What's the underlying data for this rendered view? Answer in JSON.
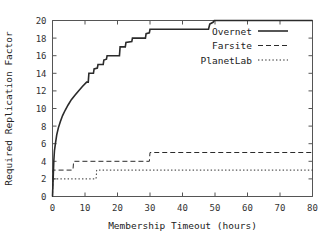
{
  "chart_data": {
    "type": "line",
    "title": "",
    "xlabel": "Membership Timeout (hours)",
    "ylabel": "Required Replication Factor",
    "xlim": [
      0,
      80
    ],
    "ylim": [
      0,
      20
    ],
    "xticks": [
      0,
      10,
      20,
      30,
      40,
      50,
      60,
      70,
      80
    ],
    "yticks": [
      0,
      2,
      4,
      6,
      8,
      10,
      12,
      14,
      16,
      18,
      20
    ],
    "xtick_labels": [
      "0",
      "10",
      "20",
      "30",
      "40",
      "50",
      "60",
      "70",
      "80"
    ],
    "ytick_labels": [
      "0",
      "2",
      "4",
      "6",
      "8",
      "10",
      "12",
      "14",
      "16",
      "18",
      "20"
    ],
    "grid": false,
    "legend_position": "top-right",
    "series": [
      {
        "name": "Overnet",
        "style": "solid",
        "color": "#2b2b2b",
        "width": 1.6,
        "points": [
          [
            0.0,
            0.0
          ],
          [
            0.2,
            2.0
          ],
          [
            0.4,
            4.0
          ],
          [
            0.6,
            5.2
          ],
          [
            0.9,
            6.0
          ],
          [
            1.3,
            7.0
          ],
          [
            1.8,
            7.8
          ],
          [
            2.4,
            8.5
          ],
          [
            3.1,
            9.2
          ],
          [
            3.9,
            9.8
          ],
          [
            4.8,
            10.4
          ],
          [
            5.8,
            11.0
          ],
          [
            6.9,
            11.5
          ],
          [
            8.0,
            12.0
          ],
          [
            9.2,
            12.5
          ],
          [
            10.5,
            13.0
          ],
          [
            11.0,
            13.0
          ],
          [
            11.2,
            14.0
          ],
          [
            12.6,
            14.0
          ],
          [
            12.8,
            14.5
          ],
          [
            13.8,
            14.6
          ],
          [
            14.0,
            15.0
          ],
          [
            15.6,
            15.0
          ],
          [
            15.8,
            15.5
          ],
          [
            16.6,
            15.6
          ],
          [
            16.8,
            16.0
          ],
          [
            20.6,
            16.0
          ],
          [
            20.8,
            17.0
          ],
          [
            22.4,
            17.0
          ],
          [
            22.6,
            17.5
          ],
          [
            24.4,
            17.6
          ],
          [
            24.6,
            18.0
          ],
          [
            28.6,
            18.0
          ],
          [
            28.8,
            18.5
          ],
          [
            29.8,
            18.6
          ],
          [
            30.0,
            19.0
          ],
          [
            36.8,
            19.0
          ],
          [
            37.0,
            19.0
          ],
          [
            48.0,
            19.0
          ],
          [
            48.4,
            19.6
          ],
          [
            49.4,
            19.8
          ],
          [
            49.8,
            20.0
          ],
          [
            80.0,
            20.0
          ]
        ]
      },
      {
        "name": "Farsite",
        "style": "dashed",
        "color": "#2b2b2b",
        "width": 1.0,
        "points": [
          [
            0.0,
            0.0
          ],
          [
            0.15,
            3.0
          ],
          [
            6.3,
            3.0
          ],
          [
            6.5,
            4.0
          ],
          [
            29.8,
            4.0
          ],
          [
            30.0,
            5.0
          ],
          [
            80.0,
            5.0
          ]
        ]
      },
      {
        "name": "PlanetLab",
        "style": "dotted",
        "color": "#2b2b2b",
        "width": 1.0,
        "points": [
          [
            0.0,
            0.0
          ],
          [
            0.1,
            2.0
          ],
          [
            13.4,
            2.0
          ],
          [
            13.6,
            3.0
          ],
          [
            80.0,
            3.0
          ]
        ]
      }
    ]
  },
  "legend": {
    "entries": [
      {
        "label": "Overnet",
        "style": "solid"
      },
      {
        "label": "Farsite",
        "style": "dashed"
      },
      {
        "label": "PlanetLab",
        "style": "dotted"
      }
    ]
  }
}
